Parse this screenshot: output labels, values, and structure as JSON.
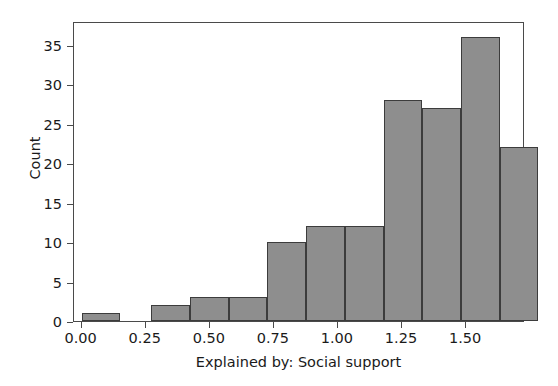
{
  "chart_data": {
    "type": "bar",
    "title": "",
    "subtitle": "",
    "xlabel": "Explained by: Social support",
    "ylabel": "Count",
    "xlim": [
      -0.03,
      1.73
    ],
    "ylim": [
      0,
      38
    ],
    "grid": false,
    "legend": null,
    "bar_color": "#8e8e8e",
    "bar_edge_color": "#3c3c3c",
    "bin_width": 0.151,
    "xticks": [
      0.0,
      0.25,
      0.5,
      0.75,
      1.0,
      1.25,
      1.5
    ],
    "xtick_labels": [
      "0.00",
      "0.25",
      "0.50",
      "0.75",
      "1.00",
      "1.25",
      "1.50"
    ],
    "yticks": [
      0,
      5,
      10,
      15,
      20,
      25,
      30,
      35
    ],
    "ytick_labels": [
      "0",
      "5",
      "10",
      "15",
      "20",
      "25",
      "30",
      "35"
    ],
    "bins": [
      {
        "left": 0.0,
        "right": 0.151,
        "value": 1
      },
      {
        "left": 0.272,
        "right": 0.423,
        "value": 2
      },
      {
        "left": 0.423,
        "right": 0.574,
        "value": 3
      },
      {
        "left": 0.574,
        "right": 0.725,
        "value": 3
      },
      {
        "left": 0.725,
        "right": 0.876,
        "value": 10
      },
      {
        "left": 0.876,
        "right": 1.027,
        "value": 12
      },
      {
        "left": 1.027,
        "right": 1.178,
        "value": 12
      },
      {
        "left": 1.178,
        "right": 1.329,
        "value": 28
      },
      {
        "left": 1.329,
        "right": 1.48,
        "value": 27
      },
      {
        "left": 1.48,
        "right": 1.631,
        "value": 36
      },
      {
        "left": 1.631,
        "right": 1.782,
        "value": 22
      }
    ],
    "categories": [
      "0.00-0.15",
      "0.27-0.42",
      "0.42-0.57",
      "0.57-0.73",
      "0.73-0.88",
      "0.88-1.03",
      "1.03-1.18",
      "1.18-1.33",
      "1.33-1.48",
      "1.48-1.63",
      "1.63-1.78"
    ],
    "values": [
      1,
      2,
      3,
      3,
      10,
      12,
      12,
      28,
      27,
      36,
      22
    ]
  }
}
